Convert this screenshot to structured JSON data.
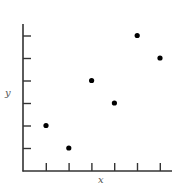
{
  "chart_data": {
    "type": "scatter",
    "title": "",
    "xlabel": "x",
    "ylabel": "y",
    "x_ticks": [
      1,
      2,
      3,
      4,
      5,
      6
    ],
    "y_ticks": [
      1,
      2,
      3,
      4,
      5,
      6
    ],
    "tick_labels_shown": false,
    "xlim": [
      0,
      6.5
    ],
    "ylim": [
      0,
      6.5
    ],
    "grid": false,
    "legend": null,
    "points": [
      {
        "x": 1,
        "y": 2
      },
      {
        "x": 2,
        "y": 1
      },
      {
        "x": 3,
        "y": 4
      },
      {
        "x": 4,
        "y": 3
      },
      {
        "x": 5,
        "y": 6
      },
      {
        "x": 6,
        "y": 5
      }
    ],
    "colors": {
      "axis": "#333333",
      "point": "#000000",
      "label": "#555555"
    }
  }
}
